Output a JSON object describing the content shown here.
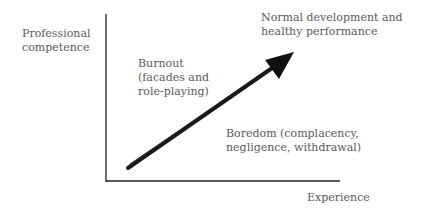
{
  "diagram": {
    "y_axis_label": [
      "Professional",
      "competence"
    ],
    "x_axis_label": "Experience",
    "arrow_label": [
      "Normal development and",
      "healthy performance"
    ],
    "upper_region_label": [
      "Burnout",
      "(facades and",
      "role-playing)"
    ],
    "lower_region_label": [
      "Boredom (complacency,",
      "negligence, withdrawal)"
    ]
  }
}
